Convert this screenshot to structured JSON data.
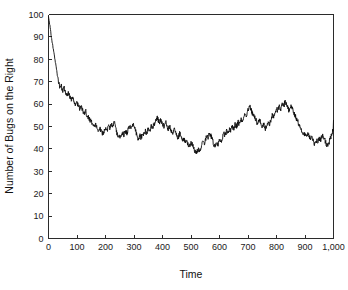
{
  "chart_data": {
    "type": "line",
    "title": "",
    "xlabel": "Time",
    "ylabel": "Number of Bugs on the Right",
    "xlim": [
      0,
      1000
    ],
    "ylim": [
      0,
      100
    ],
    "grid": false,
    "legend": null,
    "series_name": "Number of Bugs on the Right",
    "line_color": "#0d0d0d",
    "background_color": "#ffffff",
    "xticks": [
      0,
      100,
      200,
      300,
      400,
      500,
      600,
      700,
      800,
      900,
      1000
    ],
    "xtick_labels": [
      "0",
      "100",
      "200",
      "300",
      "400",
      "500",
      "600",
      "700",
      "800",
      "900",
      "1,000"
    ],
    "yticks": [
      0,
      10,
      20,
      30,
      40,
      50,
      60,
      70,
      80,
      90,
      100
    ],
    "ytick_labels": [
      "0",
      "10",
      "20",
      "30",
      "40",
      "50",
      "60",
      "70",
      "80",
      "90",
      "100"
    ],
    "x": [
      0,
      5,
      10,
      15,
      20,
      25,
      30,
      35,
      40,
      45,
      50,
      55,
      60,
      65,
      70,
      75,
      80,
      85,
      90,
      95,
      100,
      105,
      110,
      115,
      120,
      125,
      130,
      135,
      140,
      145,
      150,
      155,
      160,
      165,
      170,
      175,
      180,
      185,
      190,
      195,
      200,
      205,
      210,
      215,
      220,
      225,
      230,
      235,
      240,
      245,
      250,
      255,
      260,
      265,
      270,
      275,
      280,
      285,
      290,
      295,
      300,
      305,
      310,
      315,
      320,
      325,
      330,
      335,
      340,
      345,
      350,
      355,
      360,
      365,
      370,
      375,
      380,
      385,
      390,
      395,
      400,
      405,
      410,
      415,
      420,
      425,
      430,
      435,
      440,
      445,
      450,
      455,
      460,
      465,
      470,
      475,
      480,
      485,
      490,
      495,
      500,
      505,
      510,
      515,
      520,
      525,
      530,
      535,
      540,
      545,
      550,
      555,
      560,
      565,
      570,
      575,
      580,
      585,
      590,
      595,
      600,
      605,
      610,
      615,
      620,
      625,
      630,
      635,
      640,
      645,
      650,
      655,
      660,
      665,
      670,
      675,
      680,
      685,
      690,
      695,
      700,
      705,
      710,
      715,
      720,
      725,
      730,
      735,
      740,
      745,
      750,
      755,
      760,
      765,
      770,
      775,
      780,
      785,
      790,
      795,
      800,
      805,
      810,
      815,
      820,
      825,
      830,
      835,
      840,
      845,
      850,
      855,
      860,
      865,
      870,
      875,
      880,
      885,
      890,
      895,
      900,
      905,
      910,
      915,
      920,
      925,
      930,
      935,
      940,
      945,
      950,
      955,
      960,
      965,
      970,
      975,
      980,
      985,
      990,
      995,
      1000
    ],
    "y": [
      99,
      95,
      90,
      86,
      82,
      78,
      74,
      70,
      67,
      68,
      66,
      67,
      65,
      64,
      65,
      63,
      62,
      63,
      61,
      60,
      61,
      59,
      58,
      59,
      57,
      56,
      57,
      55,
      54,
      53,
      52,
      51,
      50,
      51,
      49,
      48,
      49,
      48,
      47,
      48,
      49,
      48,
      50,
      49,
      51,
      50,
      52,
      50,
      47,
      45,
      46,
      45,
      47,
      46,
      48,
      47,
      49,
      50,
      49,
      51,
      50,
      48,
      46,
      44,
      46,
      45,
      47,
      46,
      48,
      47,
      49,
      48,
      50,
      49,
      51,
      52,
      54,
      53,
      52,
      53,
      51,
      50,
      52,
      51,
      49,
      50,
      48,
      47,
      49,
      48,
      46,
      45,
      47,
      46,
      44,
      45,
      43,
      44,
      42,
      41,
      43,
      42,
      40,
      39,
      38,
      40,
      39,
      41,
      43,
      42,
      44,
      46,
      45,
      47,
      46,
      44,
      42,
      41,
      43,
      42,
      44,
      43,
      45,
      47,
      46,
      48,
      47,
      49,
      48,
      50,
      49,
      51,
      50,
      52,
      51,
      53,
      52,
      54,
      56,
      55,
      57,
      59,
      58,
      56,
      55,
      54,
      52,
      51,
      53,
      52,
      50,
      51,
      49,
      50,
      52,
      51,
      53,
      55,
      54,
      56,
      58,
      57,
      59,
      58,
      60,
      59,
      61,
      60,
      58,
      57,
      59,
      58,
      56,
      55,
      53,
      52,
      50,
      49,
      48,
      47,
      46,
      45,
      47,
      46,
      44,
      45,
      43,
      42,
      44,
      43,
      45,
      44,
      46,
      45,
      44,
      42,
      41,
      43,
      45,
      47,
      49,
      51,
      53,
      55,
      57,
      58,
      59,
      58,
      60,
      59,
      61,
      60,
      59,
      58,
      60,
      59,
      61,
      60,
      58,
      57,
      59,
      58,
      60,
      59,
      57,
      56,
      58,
      57,
      59,
      58,
      60,
      62,
      64,
      65,
      63,
      61,
      60,
      58,
      57,
      59,
      58,
      56,
      55,
      57,
      56,
      54,
      55,
      53,
      54,
      52,
      53,
      54,
      53
    ]
  },
  "accessibility": {
    "figure_role": "line-chart"
  }
}
